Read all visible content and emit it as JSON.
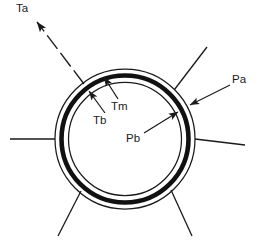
{
  "figure": {
    "type": "cross-section-diagram",
    "background_color": "#ffffff",
    "line_color": "#1a1a1a"
  },
  "geometry": {
    "center_x": 125,
    "center_y": 139,
    "radii": {
      "outer_adventitia": 70,
      "media_outer": 64,
      "media_inner": 59,
      "intima_inner": 55
    },
    "radial_spoke_angles_deg": [
      135,
      45,
      180,
      0,
      225,
      315
    ]
  },
  "labels": [
    {
      "id": "Ta",
      "text": "Ta",
      "x": 16,
      "y": 3,
      "meaning": "tension-adventitia-label",
      "leader": {
        "type": "dashed",
        "from_x": 84,
        "from_y": 83,
        "to_x": 35,
        "to_y": 20,
        "arrow_at": "to"
      }
    },
    {
      "id": "Tm",
      "text": "Tm",
      "x": 111,
      "y": 101,
      "meaning": "tension-media-label",
      "leader": {
        "type": "solid",
        "from_x": 117,
        "from_y": 98,
        "to_x": 103,
        "to_y": 76,
        "arrow_at": "to"
      }
    },
    {
      "id": "Tb",
      "text": "Tb",
      "x": 93,
      "y": 115,
      "meaning": "tension-basal-label",
      "leader": {
        "type": "solid",
        "from_x": 104,
        "from_y": 112,
        "to_x": 88,
        "to_y": 90,
        "arrow_at": "to"
      }
    },
    {
      "id": "Pa",
      "text": "Pa",
      "x": 232,
      "y": 74,
      "meaning": "pressure-adventitia-label",
      "leader": {
        "type": "solid",
        "from_x": 229,
        "from_y": 85,
        "to_x": 189,
        "to_y": 104,
        "arrow_at": "to"
      }
    },
    {
      "id": "Pb",
      "text": "Pb",
      "x": 126,
      "y": 133,
      "meaning": "pressure-blood-label",
      "leader": {
        "type": "solid",
        "from_x": 145,
        "from_y": 133,
        "to_x": 177,
        "to_y": 112,
        "arrow_at": "to"
      }
    }
  ],
  "layers": [
    {
      "name": "adventitia-outline",
      "style": "thin-line"
    },
    {
      "name": "media-band",
      "style": "thick-black-band"
    },
    {
      "name": "intima-outline",
      "style": "thin-line"
    }
  ]
}
